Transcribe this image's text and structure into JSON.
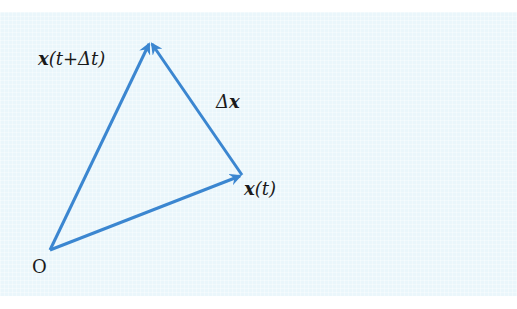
{
  "diagram": {
    "colors": {
      "background": "#eaf6fb",
      "vector": "#3b86d0",
      "text": "#1a1a1a"
    },
    "points": {
      "origin": {
        "label": "O",
        "x": 50,
        "y": 250
      },
      "x_t": {
        "x": 242,
        "y": 175
      },
      "x_t_dt": {
        "x": 150,
        "y": 42
      }
    },
    "labels": {
      "origin": "O",
      "x_t_vec": "x",
      "x_t_args": "(t)",
      "x_t_dt_vec": "x",
      "x_t_dt_args": "(t+Δt)",
      "delta_prefix": "Δ",
      "delta_vec": "x"
    },
    "vectors": [
      {
        "name": "x(t)",
        "from": "origin",
        "to": "x_t"
      },
      {
        "name": "x(t+Δt)",
        "from": "origin",
        "to": "x_t_dt"
      },
      {
        "name": "Δx",
        "from": "x_t",
        "to": "x_t_dt"
      }
    ]
  }
}
